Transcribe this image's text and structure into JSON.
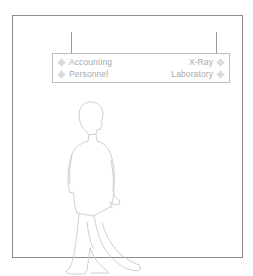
{
  "page": {
    "clipped_top_text": "",
    "background_color": "#ffffff"
  },
  "frame": {
    "name": "diagram-frame",
    "border_color": "#8c8c90"
  },
  "connectors": {
    "color": "#9a9a9e",
    "items": [
      {
        "name": "connector-left",
        "x": 58
      },
      {
        "name": "connector-right",
        "x": 203
      }
    ]
  },
  "menu_box": {
    "border_color": "#bdbdc2",
    "text_color": "#a9a9ae",
    "rows": [
      {
        "left": {
          "label": "Accounting",
          "icon": "move-arrows-icon",
          "icon_side": "leading"
        },
        "right": {
          "label": "X-Ray",
          "icon": "move-arrows-icon",
          "icon_side": "trailing"
        }
      },
      {
        "left": {
          "label": "Personnel",
          "icon": "move-arrows-icon",
          "icon_side": "leading"
        },
        "right": {
          "label": "Laboratory",
          "icon": "move-arrows-icon",
          "icon_side": "trailing"
        }
      }
    ]
  },
  "figure": {
    "name": "walking-man-outline",
    "stroke_color": "#cfcfd4"
  }
}
